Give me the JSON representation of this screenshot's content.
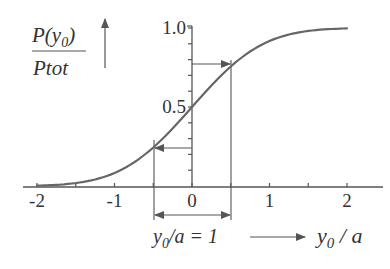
{
  "chart_data": {
    "type": "line",
    "title": "",
    "ylabel": {
      "numerator": "P(y",
      "numerator_sub": "0",
      "numerator_close": ")",
      "denominator": "Ptot"
    },
    "xlabel": {
      "main": "y",
      "sub": "0",
      "rest": " / a"
    },
    "annotation": {
      "main": "y",
      "sub": "0",
      "rest": "/a = 1",
      "description": "width y0/a = 1 spanning from -0.5 to 0.5"
    },
    "xlim": [
      -2.2,
      2.45
    ],
    "ylim": [
      0,
      1.0
    ],
    "x_ticks": [
      -2,
      -1.5,
      -1,
      -0.5,
      0,
      0.5,
      1,
      1.5,
      2
    ],
    "x_tick_labels": [
      {
        "value": -2,
        "label": "-2"
      },
      {
        "value": -1,
        "label": "-1"
      },
      {
        "value": 0,
        "label": "0"
      },
      {
        "value": 1,
        "label": "1"
      },
      {
        "value": 2,
        "label": "2"
      }
    ],
    "y_tick_labels": [
      {
        "value": 0.5,
        "label": "0.5"
      },
      {
        "value": 1.0,
        "label": "1.0"
      }
    ],
    "y_minor_ticks": [
      0.1,
      0.2,
      0.3,
      0.4,
      0.5,
      0.6,
      0.7,
      0.8,
      0.9,
      1.0
    ],
    "series": [
      {
        "name": "P(y0)/Ptot",
        "x": [
          -2.0,
          -1.75,
          -1.5,
          -1.25,
          -1.0,
          -0.75,
          -0.5,
          -0.25,
          0.0,
          0.25,
          0.5,
          0.75,
          1.0,
          1.25,
          1.5,
          1.75,
          2.0
        ],
        "values": [
          0.0,
          0.005,
          0.02,
          0.05,
          0.1,
          0.16,
          0.24,
          0.37,
          0.5,
          0.63,
          0.76,
          0.85,
          0.91,
          0.95,
          0.98,
          0.995,
          1.0
        ]
      }
    ],
    "markers": [
      {
        "x": -0.5,
        "y": 0.24,
        "arrow": "left"
      },
      {
        "x": 0.5,
        "y": 0.76,
        "arrow": "right"
      }
    ],
    "grid": false,
    "legend": null
  }
}
